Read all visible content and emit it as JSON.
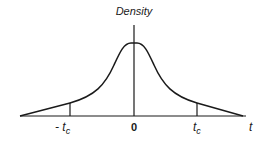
{
  "diagram": {
    "title": "Density",
    "axis_label": "t",
    "ticks": {
      "left": "- t",
      "left_sub": "c",
      "center": "0",
      "right": "t",
      "right_sub": "c"
    },
    "colors": {
      "line": "#1a1a1a",
      "background": "#ffffff"
    }
  }
}
